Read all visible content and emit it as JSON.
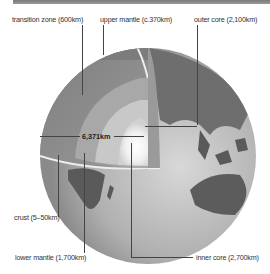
{
  "diagram": {
    "labels": {
      "transition_zone": "transition zone (600km)",
      "upper_mantle": "upper mantle (c.370km)",
      "outer_core": "outer core (2,100km)",
      "crust": "crust (5–50km)",
      "lower_mantle": "lower mantle (1,700km)",
      "inner_core": "inner core (2,700km)"
    },
    "radius_label": "6,371km",
    "colors": {
      "top_bar": "#8a8a8a",
      "mantle": "#8c8c8c",
      "core": "#c8c8c8",
      "inner_core": "#ffffff",
      "ocean": "#bdbdbd",
      "land": "#5a5a5a"
    }
  }
}
